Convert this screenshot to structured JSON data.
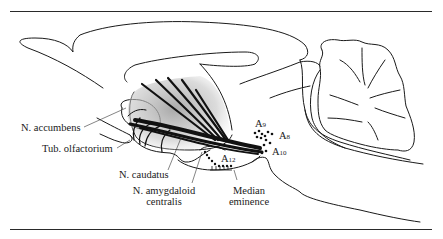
{
  "figure": {
    "type": "sagittal brain section diagram",
    "stroke_color": "#1a1a1a",
    "shading_color": "#b5b5b5",
    "labels": {
      "accumbens": "N. accumbens",
      "olfactorium": "Tub. olfactorium",
      "caudatus": "N. caudatus",
      "amygdaloid_line1": "N. amygdaloid",
      "amygdaloid_line2": "centralis",
      "median_line1": "Median",
      "median_line2": "eminence"
    },
    "cell_groups": [
      {
        "letter": "A",
        "sub": "9"
      },
      {
        "letter": "A",
        "sub": "8"
      },
      {
        "letter": "A",
        "sub": "10"
      },
      {
        "letter": "A",
        "sub": "12"
      }
    ]
  }
}
